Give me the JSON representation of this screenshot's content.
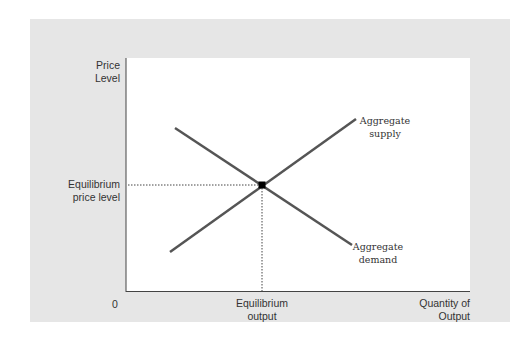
{
  "diagram": {
    "type": "aggregate supply and demand",
    "y_axis_label": [
      "Price",
      "Level"
    ],
    "x_axis_label": [
      "Quantity of",
      "Output"
    ],
    "origin_label": "0",
    "equilibrium_price_label": [
      "Equilibrium",
      "price level"
    ],
    "equilibrium_output_label": [
      "Equilibrium",
      "output"
    ],
    "curves": [
      {
        "name": "Aggregate supply",
        "label": [
          "Aggregate",
          "supply"
        ],
        "slope": "upward"
      },
      {
        "name": "Aggregate demand",
        "label": [
          "Aggregate",
          "demand"
        ],
        "slope": "downward"
      }
    ],
    "colors": {
      "panel": "#e6e6e6",
      "plot": "#ffffff",
      "line": "#555555",
      "point": "#000000"
    }
  }
}
